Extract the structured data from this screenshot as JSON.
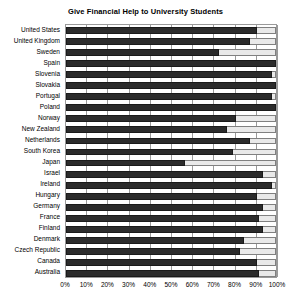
{
  "chart_data": {
    "type": "bar",
    "orientation": "horizontal",
    "title": "Give Financial Help to University Students",
    "xlabel": "",
    "ylabel": "",
    "xlim": [
      0,
      100
    ],
    "grid": true,
    "legend": false,
    "unit": "%",
    "xticks": [
      0,
      10,
      20,
      30,
      40,
      50,
      60,
      70,
      80,
      90,
      100
    ],
    "xtick_labels": [
      "0%",
      "10%",
      "20%",
      "30%",
      "40%",
      "50%",
      "60%",
      "70%",
      "80%",
      "90%",
      "100%"
    ],
    "categories": [
      "United States",
      "United Kingdom",
      "Sweden",
      "Spain",
      "Slovenia",
      "Slovakia",
      "Portugal",
      "Poland",
      "Norway",
      "New Zealand",
      "Netherlands",
      "South Korea",
      "Japan",
      "Israel",
      "Ireland",
      "Hungary",
      "Germany",
      "France",
      "Finland",
      "Denmark",
      "Czech Republic",
      "Canada",
      "Australia"
    ],
    "values": [
      90,
      87,
      72,
      99,
      97,
      99,
      97,
      99,
      80,
      76,
      87,
      79,
      56,
      93,
      97,
      90,
      93,
      91,
      93,
      84,
      82,
      90,
      91
    ],
    "series": [
      {
        "name": "Agree",
        "color": "#2b2b2b",
        "values": [
          90,
          87,
          72,
          99,
          97,
          99,
          97,
          99,
          80,
          76,
          87,
          79,
          56,
          93,
          97,
          90,
          93,
          91,
          93,
          84,
          82,
          90,
          91
        ]
      }
    ],
    "remainder_color": "#e9e9e9"
  },
  "axis": {
    "grid_color": "#9a9a9a",
    "frame_color": "#9a9a9a"
  }
}
